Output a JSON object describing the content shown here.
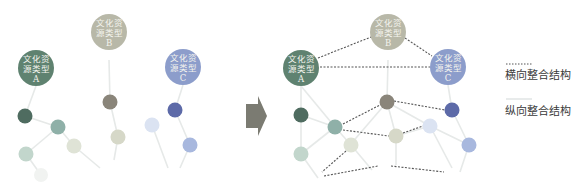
{
  "diagram": {
    "title": "",
    "before": {
      "hubs": [
        {
          "id": "A",
          "line1": "文化资",
          "line2": "源类型",
          "line3": "A",
          "color": "#5f8270"
        },
        {
          "id": "B",
          "line1": "文化资",
          "line2": "源类型",
          "line3": "B",
          "color": "#b8b8a8"
        },
        {
          "id": "C",
          "line1": "文化资",
          "line2": "源类型",
          "line3": "C",
          "color": "#8c9dcb"
        }
      ]
    },
    "after": {
      "hubs": [
        {
          "id": "A",
          "line1": "文化资",
          "line2": "源类型",
          "line3": "A",
          "color": "#5f8270"
        },
        {
          "id": "B",
          "line1": "文化资",
          "line2": "源类型",
          "line3": "B",
          "color": "#b8b8a8"
        },
        {
          "id": "C",
          "line1": "文化资",
          "line2": "源类型",
          "line3": "C",
          "color": "#8c9dcb"
        }
      ]
    },
    "arrow": {
      "direction": "right",
      "color": "#7b7b72"
    },
    "legend": {
      "horizontal": {
        "label": "横向整合结构",
        "line_style": "dashed",
        "color": "#555555"
      },
      "vertical": {
        "label": "纵向整合结构",
        "line_style": "solid",
        "color": "#dfe3e2"
      }
    },
    "node_colors": {
      "dark_green": "#4f6c60",
      "teal": "#8fb0a8",
      "light_green": "#c2d6cc",
      "pale_cream": "#dfe3d6",
      "gray_brown": "#8a857a",
      "light_beige": "#d6d8c8",
      "light_blue": "#dbe3f2",
      "dark_blue": "#5d6aa8",
      "medium_blue": "#a8b8de",
      "faint": "#eef0ee"
    }
  }
}
